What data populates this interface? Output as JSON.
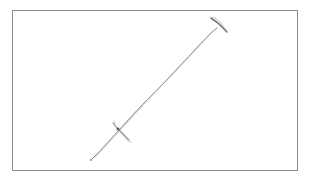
{
  "canvas": {
    "subject": "pencil sketch of a sword",
    "background_color": "#ffffff",
    "frame_color": "#8c8c8c",
    "stroke_colors": {
      "blade": "#6e6e6e",
      "pommel": "#5a5a5a",
      "crossguard": "#707070",
      "tip": "#8a8a8a"
    }
  }
}
